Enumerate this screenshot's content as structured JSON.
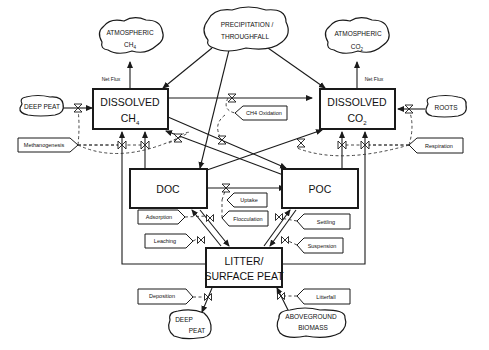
{
  "diagram": {
    "stocks": {
      "dissolved_ch4": {
        "line1": "DISSOLVED",
        "line2": "CH",
        "sub": "4"
      },
      "dissolved_co2": {
        "line1": "DISSOLVED",
        "line2": "CO",
        "sub": "2"
      },
      "doc": {
        "label": "DOC"
      },
      "poc": {
        "label": "POC"
      },
      "litter": {
        "line1": "LITTER/",
        "line2": "SURFACE PEAT"
      }
    },
    "sources_sinks": {
      "atmospheric_ch4": {
        "line1": "ATMOSPHERIC",
        "line2": "CH",
        "sub": "4"
      },
      "atmospheric_co2": {
        "line1": "ATMOSPHERIC",
        "line2": "CO",
        "sub": "2"
      },
      "precipitation": {
        "line1": "PRECIPITATION /",
        "line2": "THROUGHFALL"
      },
      "deep_peat_left": {
        "label": "DEEP PEAT"
      },
      "roots": {
        "label": "ROOTS"
      },
      "deep_peat_bottom": {
        "line1": "DEEP",
        "line2": "PEAT"
      },
      "aboveground_biomass": {
        "line1": "ABOVEGROUND",
        "line2": "BIOMASS"
      }
    },
    "processes": {
      "methanogenesis": "Methanogenesis",
      "ch4_oxidation": "CH4 Oxidation",
      "respiration": "Respiration",
      "uptake": "Uptake",
      "flocculation": "Flocculation",
      "adsorption": "Adsorption",
      "leaching": "Leaching",
      "settling": "Settling",
      "suspension": "Suspension",
      "deposition": "Deposition",
      "litterfall": "Litterfall"
    },
    "flow_labels": {
      "net_flux_ch4": "Net Flux",
      "net_flux_co2": "Net Flux"
    }
  }
}
